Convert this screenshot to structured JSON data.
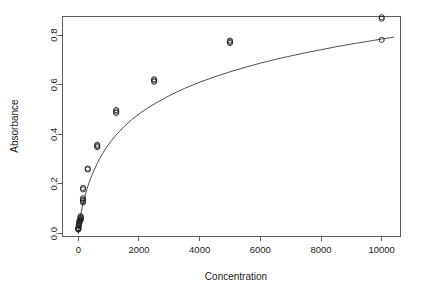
{
  "chart_data": {
    "type": "scatter",
    "title": "",
    "xlabel": "Concentration",
    "ylabel": "Absorbance",
    "xlim": [
      -520,
      10620
    ],
    "ylim": [
      -0.012,
      0.875
    ],
    "grid": false,
    "legend": "none",
    "xticks": [
      0,
      2000,
      4000,
      6000,
      8000,
      10000
    ],
    "xticklabels": [
      "0",
      "2000",
      "4000",
      "6000",
      "8000",
      "10000"
    ],
    "yticks": [
      0.0,
      0.2,
      0.4,
      0.6,
      0.8
    ],
    "yticklabels": [
      "0.0",
      "0.2",
      "0.4",
      "0.6",
      "0.8"
    ],
    "point_marker": "open-circle",
    "point_radius_px": 2.6,
    "points": [
      {
        "x": 0,
        "y": 0.016
      },
      {
        "x": 0,
        "y": 0.018
      },
      {
        "x": 0,
        "y": 0.02
      },
      {
        "x": 0,
        "y": 0.022
      },
      {
        "x": 20,
        "y": 0.03
      },
      {
        "x": 20,
        "y": 0.034
      },
      {
        "x": 20,
        "y": 0.038
      },
      {
        "x": 39,
        "y": 0.044
      },
      {
        "x": 39,
        "y": 0.048
      },
      {
        "x": 39,
        "y": 0.052
      },
      {
        "x": 78,
        "y": 0.055
      },
      {
        "x": 78,
        "y": 0.058
      },
      {
        "x": 78,
        "y": 0.062
      },
      {
        "x": 78,
        "y": 0.066
      },
      {
        "x": 78,
        "y": 0.07
      },
      {
        "x": 156,
        "y": 0.125
      },
      {
        "x": 156,
        "y": 0.131
      },
      {
        "x": 156,
        "y": 0.136
      },
      {
        "x": 156,
        "y": 0.142
      },
      {
        "x": 156,
        "y": 0.178
      },
      {
        "x": 156,
        "y": 0.184
      },
      {
        "x": 313,
        "y": 0.258
      },
      {
        "x": 313,
        "y": 0.262
      },
      {
        "x": 625,
        "y": 0.348
      },
      {
        "x": 625,
        "y": 0.353
      },
      {
        "x": 625,
        "y": 0.358
      },
      {
        "x": 1250,
        "y": 0.486
      },
      {
        "x": 1250,
        "y": 0.492
      },
      {
        "x": 1250,
        "y": 0.498
      },
      {
        "x": 2500,
        "y": 0.612
      },
      {
        "x": 2500,
        "y": 0.617
      },
      {
        "x": 2500,
        "y": 0.622
      },
      {
        "x": 5000,
        "y": 0.768
      },
      {
        "x": 5000,
        "y": 0.773
      },
      {
        "x": 5000,
        "y": 0.778
      },
      {
        "x": 10000,
        "y": 0.866
      },
      {
        "x": 10000,
        "y": 0.872
      },
      {
        "x": 10000,
        "y": 0.781
      }
    ],
    "curve": {
      "description": "fitted saturation curve",
      "points": [
        {
          "x": 0,
          "y": 0.0
        },
        {
          "x": 40,
          "y": 0.045
        },
        {
          "x": 80,
          "y": 0.075
        },
        {
          "x": 120,
          "y": 0.1
        },
        {
          "x": 160,
          "y": 0.122
        },
        {
          "x": 200,
          "y": 0.142
        },
        {
          "x": 250,
          "y": 0.165
        },
        {
          "x": 313,
          "y": 0.19
        },
        {
          "x": 400,
          "y": 0.22
        },
        {
          "x": 500,
          "y": 0.25
        },
        {
          "x": 625,
          "y": 0.283
        },
        {
          "x": 750,
          "y": 0.312
        },
        {
          "x": 900,
          "y": 0.342
        },
        {
          "x": 1050,
          "y": 0.368
        },
        {
          "x": 1250,
          "y": 0.398
        },
        {
          "x": 1500,
          "y": 0.43
        },
        {
          "x": 1750,
          "y": 0.458
        },
        {
          "x": 2000,
          "y": 0.482
        },
        {
          "x": 2250,
          "y": 0.503
        },
        {
          "x": 2500,
          "y": 0.522
        },
        {
          "x": 3000,
          "y": 0.556
        },
        {
          "x": 3500,
          "y": 0.585
        },
        {
          "x": 4000,
          "y": 0.61
        },
        {
          "x": 4500,
          "y": 0.632
        },
        {
          "x": 5000,
          "y": 0.652
        },
        {
          "x": 5500,
          "y": 0.67
        },
        {
          "x": 6000,
          "y": 0.687
        },
        {
          "x": 6500,
          "y": 0.702
        },
        {
          "x": 7000,
          "y": 0.716
        },
        {
          "x": 7500,
          "y": 0.729
        },
        {
          "x": 8000,
          "y": 0.741
        },
        {
          "x": 8500,
          "y": 0.753
        },
        {
          "x": 9000,
          "y": 0.764
        },
        {
          "x": 9500,
          "y": 0.774
        },
        {
          "x": 10000,
          "y": 0.784
        },
        {
          "x": 10400,
          "y": 0.792
        }
      ]
    },
    "colors": {
      "axis": "#4d4d4d",
      "text": "#1a1a1a",
      "curve": "#3a3a3a",
      "point": "#1a1a1a",
      "background": "#ffffff"
    }
  }
}
